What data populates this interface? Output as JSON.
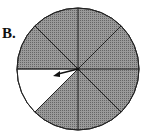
{
  "label": "B.",
  "spinner": {
    "sectors": 8,
    "shaded_sectors": 7,
    "unshaded_sectors": 1,
    "shaded_color": "#8a8a8a",
    "unshaded_color": "#ffffff",
    "arrow": "pointing to unshaded sector"
  }
}
